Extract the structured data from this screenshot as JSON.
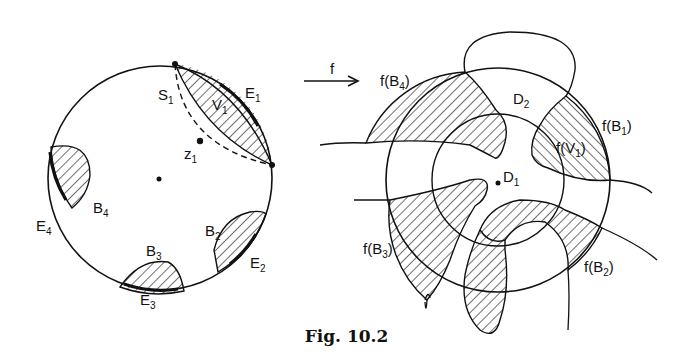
{
  "figure": {
    "caption": "Fig. 10.2",
    "arrow_label": "f",
    "left_disk": {
      "labels": {
        "S": "S",
        "S_sub": "1",
        "V": "V",
        "V_sub": "1",
        "E1": "E",
        "E1_sub": "1",
        "z": "z",
        "z_sub": "1",
        "B4": "B",
        "B4_sub": "4",
        "E4": "E",
        "E4_sub": "4",
        "B3": "B",
        "B3_sub": "3",
        "E3": "E",
        "E3_sub": "3",
        "B2": "B",
        "B2_sub": "2",
        "E2": "E",
        "E2_sub": "2"
      }
    },
    "right_disk": {
      "labels": {
        "fB4": "f(B",
        "fB4_sub": "4",
        "fB4_end": ")",
        "D2": "D",
        "D2_sub": "2",
        "fB1": "f(B",
        "fB1_sub": "1",
        "fB1_end": ")",
        "fV1": "f(V",
        "fV1_sub": "1",
        "fV1_end": ")",
        "D1": "D",
        "D1_sub": "1",
        "fB3": "f(B",
        "fB3_sub": "3",
        "fB3_end": ")",
        "fB2": "f(B",
        "fB2_sub": "2",
        "fB2_end": ")"
      }
    }
  }
}
